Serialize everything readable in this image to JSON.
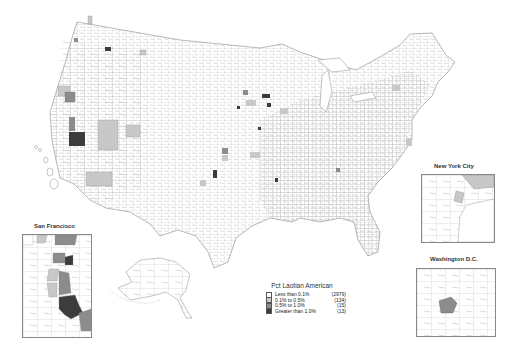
{
  "map": {
    "subject": "Laotian American population share by U.S. county",
    "colors": {
      "background": "#ffffff",
      "county_border": "#8a8a8a",
      "class_1": "#ffffff",
      "class_2": "#c8c8c8",
      "class_3": "#8c8c8c",
      "class_4": "#3c3c3c"
    }
  },
  "legend": {
    "title": "Pct Laotian American",
    "items": [
      {
        "label": "Less than 0.1%",
        "count": "(2979)",
        "color": "#ffffff"
      },
      {
        "label": "0.1% to 0.5%",
        "count": "(134)",
        "color": "#c8c8c8"
      },
      {
        "label": "0.5% to 1.0%",
        "count": "(15)",
        "color": "#8c8c8c"
      },
      {
        "label": "Greater than 1.0%",
        "count": "(13)",
        "color": "#3c3c3c"
      }
    ]
  },
  "insets": {
    "san_francisco": {
      "title": "San Francisco"
    },
    "new_york_city": {
      "title": "New York City"
    },
    "washington_dc": {
      "title": "Washington D.C."
    }
  }
}
